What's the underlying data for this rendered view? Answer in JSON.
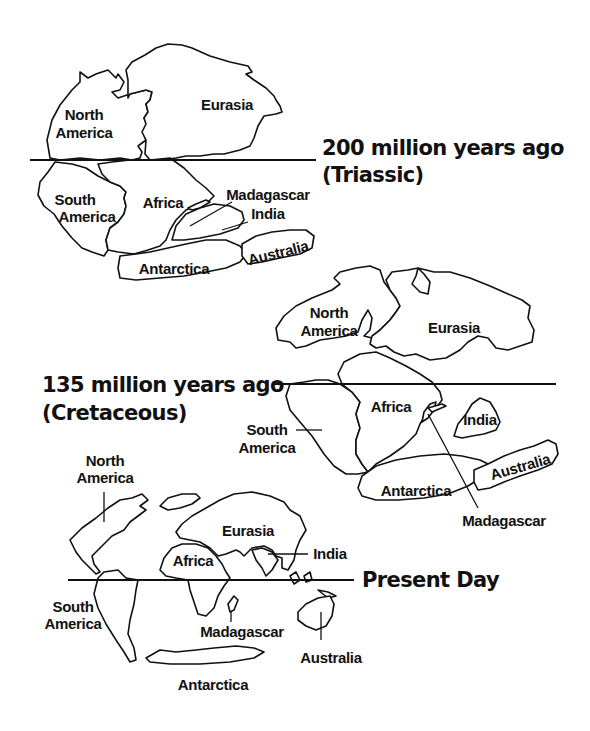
{
  "diagram": {
    "stroke_color": "#111111",
    "background_color": "#ffffff"
  },
  "eras": {
    "triassic": {
      "title_line1": "200 million years ago",
      "title_line2": "(Triassic)",
      "labels": {
        "north_america_1": "North",
        "north_america_2": "America",
        "eurasia": "Eurasia",
        "south_america_1": "South",
        "south_america_2": "America",
        "africa": "Africa",
        "madagascar": "Madagascar",
        "india": "India",
        "antarctica": "Antarctica",
        "australia": "Australia"
      }
    },
    "cretaceous": {
      "title_line1": "135 million years ago",
      "title_line2": "(Cretaceous)",
      "labels": {
        "north_america_1": "North",
        "north_america_2": "America",
        "eurasia": "Eurasia",
        "south_america_1": "South",
        "south_america_2": "America",
        "africa": "Africa",
        "india": "India",
        "antarctica": "Antarctica",
        "australia": "Australia",
        "madagascar": "Madagascar"
      }
    },
    "present": {
      "title_line1": "Present Day",
      "labels": {
        "north_america_1": "North",
        "north_america_2": "America",
        "eurasia": "Eurasia",
        "africa": "Africa",
        "india": "India",
        "south_america_1": "South",
        "south_america_2": "America",
        "madagascar": "Madagascar",
        "australia": "Australia",
        "antarctica": "Antarctica"
      }
    }
  }
}
